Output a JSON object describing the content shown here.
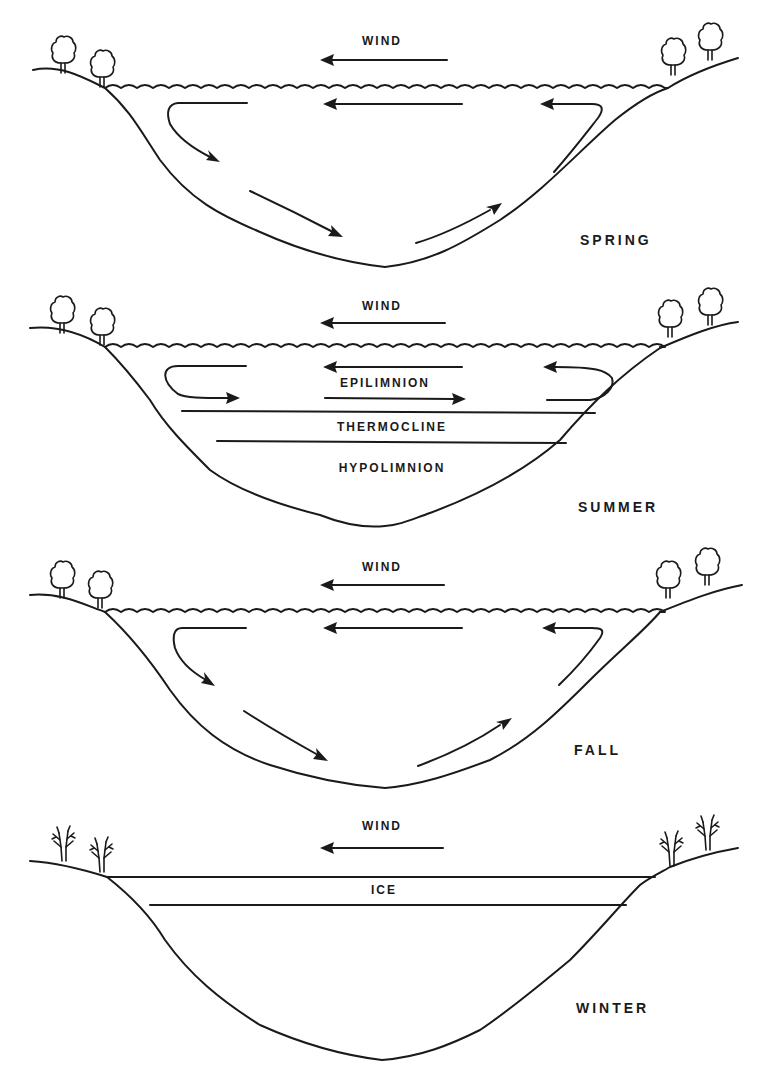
{
  "diagram": {
    "panels": [
      {
        "season": "SPRING",
        "wind_label": "WIND",
        "layers": [],
        "tree_type": "leafy"
      },
      {
        "season": "SUMMER",
        "wind_label": "WIND",
        "layers": [
          "EPILIMNION",
          "THERMOCLINE",
          "HYPOLIMNION"
        ],
        "tree_type": "leafy"
      },
      {
        "season": "FALL",
        "wind_label": "WIND",
        "layers": [],
        "tree_type": "leafy"
      },
      {
        "season": "WINTER",
        "wind_label": "WIND",
        "layers": [
          "ICE"
        ],
        "tree_type": "bare"
      }
    ],
    "colors": {
      "ink": "#1a1a1a",
      "background": "#ffffff"
    }
  }
}
